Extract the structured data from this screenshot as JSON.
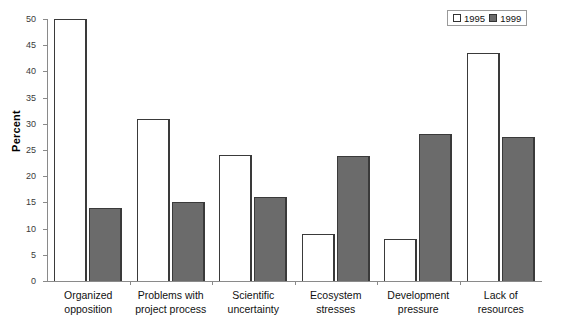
{
  "chart_data": {
    "type": "bar",
    "title": "",
    "xlabel": "",
    "ylabel": "Percent",
    "ylim": [
      0,
      50
    ],
    "yticks": [
      0,
      5,
      10,
      15,
      20,
      25,
      30,
      35,
      40,
      45,
      50
    ],
    "grid": false,
    "legend_position": "top-right",
    "categories": [
      "Organized opposition",
      "Problems with project process",
      "Scientific uncertainty",
      "Ecosystem stresses",
      "Development pressure",
      "Lack of resources"
    ],
    "category_lines": [
      [
        "Organized",
        "opposition"
      ],
      [
        "Problems with",
        "project process"
      ],
      [
        "Scientific",
        "uncertainty"
      ],
      [
        "Ecosystem",
        "stresses"
      ],
      [
        "Development",
        "pressure"
      ],
      [
        "Lack of",
        "resources"
      ]
    ],
    "series": [
      {
        "name": "1995",
        "color": "#ffffff",
        "values": [
          50,
          31,
          24,
          9,
          8,
          43.5
        ]
      },
      {
        "name": "1999",
        "color": "#6b6b6b",
        "values": [
          14,
          15,
          16,
          23.8,
          28,
          27.5
        ]
      }
    ]
  },
  "axis": {
    "y_title": "Percent",
    "tick_labels": [
      "0",
      "5",
      "10",
      "15",
      "20",
      "25",
      "30",
      "35",
      "40",
      "45",
      "50"
    ]
  },
  "legend": {
    "entries": [
      {
        "label": "1995",
        "swatch": "white"
      },
      {
        "label": "1999",
        "swatch": "gray"
      }
    ]
  }
}
